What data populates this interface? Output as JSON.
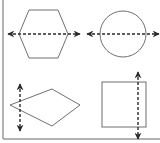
{
  "diagram": {
    "title": "",
    "colors": {
      "background": "#ffffff",
      "shape_stroke": "#6f6f6f",
      "axis_stroke": "#2a2a2a",
      "border": "#9a9a9a"
    },
    "panels": [
      {
        "shape": "hexagon",
        "axis": "horizontal",
        "line_style": "dashed",
        "arrowheads": "both"
      },
      {
        "shape": "circle",
        "axis": "horizontal",
        "line_style": "dashed",
        "arrowheads": "both"
      },
      {
        "shape": "rhombus",
        "axis": "vertical",
        "line_style": "dashed",
        "arrowheads": "both",
        "note": "line does not pass through center"
      },
      {
        "shape": "square",
        "axis": "vertical",
        "line_style": "dashed",
        "arrowheads": "both",
        "note": "line does not pass through center"
      }
    ]
  }
}
